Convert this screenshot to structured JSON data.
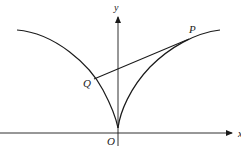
{
  "diagram": {
    "axes": {
      "x_label": "x",
      "y_label": "y",
      "origin_label": "O"
    },
    "points": [
      {
        "id": "P",
        "label": "P"
      },
      {
        "id": "Q",
        "label": "Q"
      }
    ],
    "elements": [
      "semicubical parabola (cusp at O)",
      "chord PQ tangent at P"
    ],
    "colors": {
      "stroke": "#1a1a1a",
      "background": "#ffffff"
    }
  }
}
